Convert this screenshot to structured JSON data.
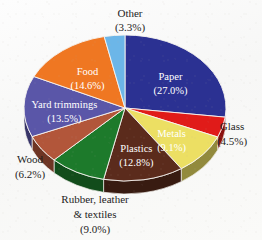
{
  "chart_data": {
    "type": "pie",
    "title": "",
    "subtitle": "",
    "xlabel": "",
    "ylabel": "",
    "legend_position": "none",
    "grid": false,
    "units": "percent",
    "start_angle_deg": 0,
    "direction": "clockwise",
    "three_d": true,
    "categories": [
      "Paper",
      "Glass",
      "Metals",
      "Plastics",
      "Rubber, leather & textiles",
      "Wood",
      "Yard trimmings",
      "Food",
      "Other"
    ],
    "values": [
      27.0,
      4.5,
      9.1,
      12.8,
      9.0,
      6.2,
      13.5,
      14.6,
      3.3
    ],
    "colors": [
      "#2b3192",
      "#e01b19",
      "#ecdf63",
      "#5b2b1c",
      "#1d7a2b",
      "#b2563a",
      "#5a56a8",
      "#ef7722",
      "#6cb6e8"
    ],
    "slices": [
      {
        "name": "Paper",
        "label": "Paper",
        "value_label": "(27.0%)",
        "value": 27.0,
        "color": "#2b3192",
        "label_placement": "inside",
        "label_color": "#ffffff"
      },
      {
        "name": "Glass",
        "label": "Glass",
        "value_label": "(4.5%)",
        "value": 4.5,
        "color": "#e01b19",
        "label_placement": "outside",
        "label_color": "#1d1d1d"
      },
      {
        "name": "Metals",
        "label": "Metals",
        "value_label": "(9.1%)",
        "value": 9.1,
        "color": "#ecdf63",
        "label_placement": "inside",
        "label_color": "#2a2a15"
      },
      {
        "name": "Plastics",
        "label": "Plastics",
        "value_label": "(12.8%)",
        "value": 12.8,
        "color": "#5b2b1c",
        "label_placement": "inside",
        "label_color": "#ffffff"
      },
      {
        "name": "Rubber, leather & textiles",
        "label_line1": "Rubber, leather",
        "label_line2": "& textiles",
        "value_label": "(9.0%)",
        "value": 9.0,
        "color": "#1d7a2b",
        "label_placement": "outside",
        "label_color": "#1d1d1d"
      },
      {
        "name": "Wood",
        "label": "Wood",
        "value_label": "(6.2%)",
        "value": 6.2,
        "color": "#b2563a",
        "label_placement": "outside",
        "label_color": "#1d1d1d"
      },
      {
        "name": "Yard trimmings",
        "label": "Yard trimmings",
        "value_label": "(13.5%)",
        "value": 13.5,
        "color": "#5a56a8",
        "label_placement": "inside",
        "label_color": "#ffffff"
      },
      {
        "name": "Food",
        "label": "Food",
        "value_label": "(14.6%)",
        "value": 14.6,
        "color": "#ef7722",
        "label_placement": "inside",
        "label_color": "#ffffff"
      },
      {
        "name": "Other",
        "label": "Other",
        "value_label": "(3.3%)",
        "value": 3.3,
        "color": "#6cb6e8",
        "label_placement": "outside",
        "label_color": "#1d1d1d"
      }
    ]
  }
}
